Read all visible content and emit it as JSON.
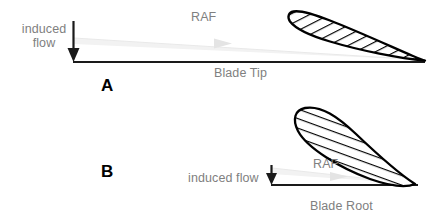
{
  "figure": {
    "background_color": "#ffffff",
    "label_color": "#808080",
    "line_color": "#000000",
    "raf_arrow_color": "#e6e6e6"
  },
  "panels": [
    {
      "id": "A",
      "letter": "A",
      "induced_flow_label_line1": "induced",
      "induced_flow_label_line2": "flow",
      "raf_label": "RAF",
      "baseline_label": "Blade Tip",
      "airfoil": {
        "name": "airfoil-shallow-angle",
        "hatched": true,
        "angle_of_attack_deg": 10
      }
    },
    {
      "id": "B",
      "letter": "B",
      "induced_flow_label_line1": "induced flow",
      "induced_flow_label_line2": "",
      "raf_label": "RAF",
      "baseline_label": "Blade Root",
      "airfoil": {
        "name": "airfoil-steep-angle",
        "hatched": true,
        "angle_of_attack_deg": 45
      }
    }
  ],
  "icons": {
    "induced_flow_arrow": "down-arrow-icon",
    "raf_arrow": "right-arrow-icon"
  }
}
